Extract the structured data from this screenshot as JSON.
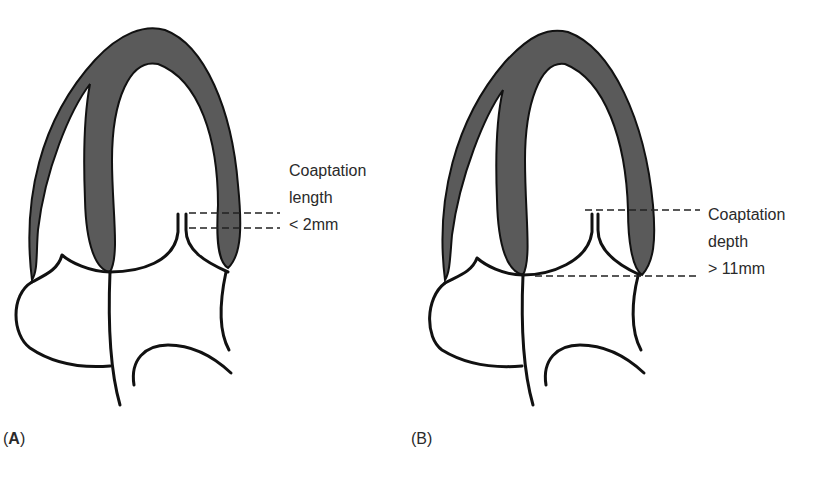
{
  "colors": {
    "wall_fill": "#5a5a5a",
    "outline": "#111111",
    "background": "#ffffff"
  },
  "panels": [
    {
      "id": "A",
      "tag_open": "(",
      "tag_letter": "A",
      "tag_close": ")",
      "annotation": {
        "line1": "Coaptation",
        "line2": "length",
        "line3": "< 2mm"
      },
      "measure": "coaptation-length"
    },
    {
      "id": "B",
      "tag_open": "(",
      "tag_letter": "B",
      "tag_close": ")",
      "annotation": {
        "line1": "Coaptation",
        "line2": "depth",
        "line3": "> 11mm"
      },
      "measure": "coaptation-depth"
    }
  ]
}
